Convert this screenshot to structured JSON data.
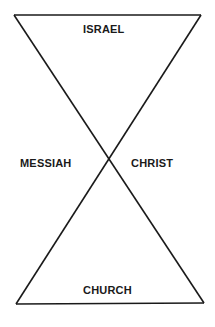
{
  "diagram": {
    "type": "hourglass",
    "labels": {
      "top": "ISRAEL",
      "left": "MESSIAH",
      "right": "CHRIST",
      "bottom": "CHURCH"
    },
    "colors": {
      "line": "#1a1a1a",
      "text": "#1a1a1a",
      "background": "#ffffff"
    }
  }
}
